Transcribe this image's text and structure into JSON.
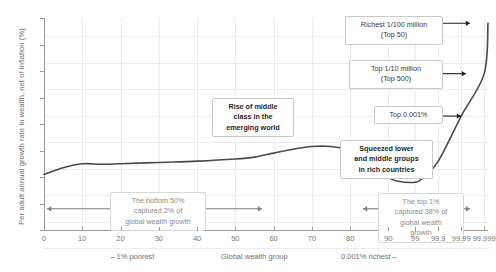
{
  "chart_data": {
    "type": "line",
    "title": "",
    "ylabel": "Per adult annual growth rate in wealth, net of inflation (%)",
    "xlabel": "Global wealth group",
    "xlabel_left": "←1% poorest",
    "xlabel_right": "0.001% richest→",
    "ylim": [
      1,
      9
    ],
    "yticks": [
      "1%",
      "2%",
      "3%",
      "4%",
      "5%",
      "6%",
      "7%",
      "8%",
      "9%"
    ],
    "ytick_values": [
      1,
      2,
      3,
      4,
      5,
      6,
      7,
      8,
      9
    ],
    "xticks": [
      "0",
      "10",
      "20",
      "30",
      "40",
      "50",
      "60",
      "70",
      "80",
      "90",
      "99",
      "99.9",
      "99.99",
      "99.999"
    ],
    "grid": true,
    "legend": "none",
    "series": [
      {
        "name": "Per adult annual wealth growth rate",
        "color": "#4a4a4a",
        "x": [
          "0",
          "5",
          "10",
          "15",
          "20",
          "30",
          "40",
          "50",
          "55",
          "60",
          "65",
          "70",
          "75",
          "80",
          "85",
          "90",
          "95",
          "99",
          "99.5",
          "99.9",
          "99.99",
          "99.999",
          "99.9999"
        ],
        "values": [
          3.1,
          3.35,
          3.5,
          3.48,
          3.5,
          3.55,
          3.6,
          3.68,
          3.75,
          3.9,
          4.05,
          4.15,
          4.15,
          4.0,
          3.5,
          3.0,
          2.85,
          2.8,
          2.95,
          3.6,
          5.3,
          6.9,
          8.8
        ]
      }
    ],
    "annotations": [
      {
        "name": "richest-1-per-100-million",
        "text": "Richest 1/100 million\n(Top 50)",
        "style": "plain",
        "y_value": 8.8
      },
      {
        "name": "top-1-per-10-million",
        "text": "Top 1/10 million\n(Top 500)",
        "style": "plain",
        "y_value": 6.9
      },
      {
        "name": "top-0001-percent",
        "text": "Top 0.001%",
        "style": "plain",
        "y_value": 5.3
      },
      {
        "name": "rise-of-middle-class",
        "text": "Rise of middle\nclass in the\nemerging world",
        "style": "bold"
      },
      {
        "name": "squeezed-groups",
        "text": "Squeezed lower\nand middle groups\nin rich countries",
        "style": "bold"
      },
      {
        "name": "bottom-50-share",
        "text": "The bottom 50%\ncaptured 2% of\nglobal wealth growth",
        "style": "soft",
        "y_value": 1.8
      },
      {
        "name": "top-1-share",
        "text": "The top 1%\ncaptured 38% of\nglobal wealth\ngrowth",
        "style": "soft",
        "y_value": 1.8
      }
    ]
  },
  "callouts": {
    "richest_line1": "Richest 1/100 million",
    "richest_line2": "(Top 50)",
    "top10m_line1": "Top 1/10 million",
    "top10m_line2": "(Top 500)",
    "top001": "Top 0.001%",
    "middle_line1": "Rise of middle",
    "middle_line2": "class in the",
    "middle_line3": "emerging world",
    "squeezed_line1": "Squeezed lower",
    "squeezed_line2": "and middle groups",
    "squeezed_line3": "in rich countries",
    "bottom50_line1": "The bottom 50%",
    "bottom50_line2": "captured 2% of",
    "bottom50_line3": "global wealth growth",
    "top1_line1": "The top 1%",
    "top1_line2": "captured 38% of",
    "top1_line3": "global wealth",
    "top1_line4": "growth"
  },
  "axes": {
    "ylabel": "Per adult annual growth rate in wealth, net of inflation (%)",
    "xlabel_center": "Global wealth group",
    "xlabel_left": "←1% poorest",
    "xlabel_right": "0.001% richest→"
  }
}
